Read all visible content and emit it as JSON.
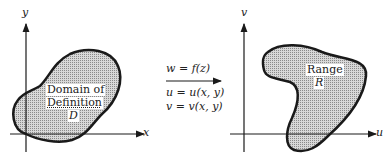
{
  "left_plane": {
    "x_axis_label": "x",
    "y_axis_label": "y",
    "region_label_line1": "Domain of",
    "region_label_line2": "Definition",
    "region_symbol": "D"
  },
  "mapping": {
    "function": "w = f(z)",
    "u_eq": "u = u(x, y)",
    "v_eq": "v = v(x, y)"
  },
  "right_plane": {
    "u_axis_label": "u",
    "v_axis_label": "v",
    "region_label": "Range",
    "region_symbol": "R"
  },
  "colors": {
    "region_fill": "#c8c8c8",
    "outline": "#1a1a1a"
  }
}
